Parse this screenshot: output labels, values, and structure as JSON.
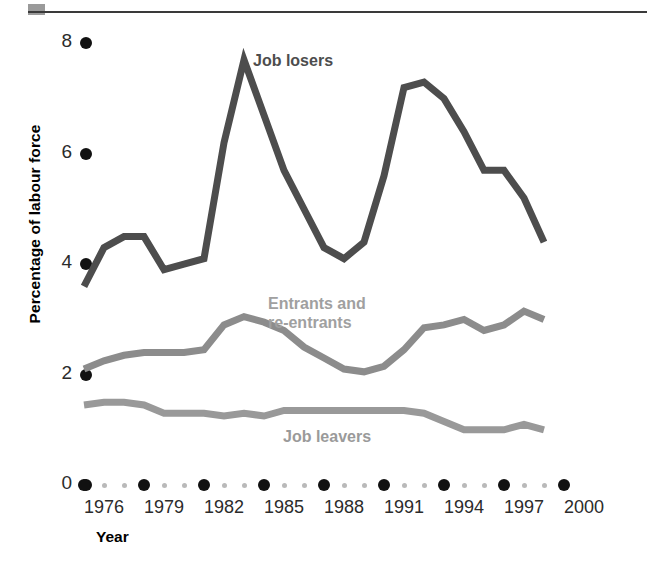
{
  "figure": {
    "decoration": {
      "top_rule": true,
      "top_marker_color": "#9a9a9a"
    }
  },
  "axes": {
    "y_title": "Percentage of labour force",
    "x_title": "Year",
    "y_ticks": [
      "8",
      "6",
      "4",
      "2",
      "0"
    ],
    "x_ticks": [
      "1976",
      "1979",
      "1982",
      "1985",
      "1988",
      "1991",
      "1994",
      "1997",
      "2000"
    ]
  },
  "labels": {
    "job_losers": "Job losers",
    "entrants": "Entrants and\nre-entrants",
    "job_leavers": "Job leavers"
  },
  "colors": {
    "job_losers": "#4d4d4d",
    "entrants": "#8c8c8c",
    "job_leavers": "#999999",
    "job_losers_label": "#4d4d4d",
    "entrants_label": "#a0a0a0",
    "job_leavers_label": "#9a9a9a",
    "tick_major": "#111111",
    "tick_minor": "#b9b9b9",
    "rule": "#3a3a3a"
  },
  "chart_data": {
    "type": "line",
    "title": "",
    "xlabel": "Year",
    "ylabel": "Percentage of labour force",
    "xlim": [
      1975,
      2000
    ],
    "ylim": [
      0,
      8
    ],
    "ytick_values": [
      8,
      6,
      4,
      2,
      0
    ],
    "xtick_values": [
      1976,
      1979,
      1982,
      1985,
      1988,
      1991,
      1994,
      1997,
      2000
    ],
    "grid": false,
    "legend": "inline-annotations",
    "x": [
      1975,
      1976,
      1977,
      1978,
      1979,
      1980,
      1981,
      1982,
      1983,
      1984,
      1985,
      1986,
      1987,
      1988,
      1989,
      1990,
      1991,
      1992,
      1993,
      1994,
      1995,
      1996,
      1997,
      1998
    ],
    "series": [
      {
        "name": "Job losers",
        "color": "#4d4d4d",
        "values": [
          3.6,
          4.3,
          4.5,
          4.5,
          3.9,
          4.0,
          4.1,
          6.2,
          7.7,
          6.7,
          5.7,
          5.0,
          4.3,
          4.1,
          4.4,
          5.6,
          7.2,
          7.3,
          7.0,
          6.4,
          5.7,
          5.7,
          5.2,
          4.4
        ]
      },
      {
        "name": "Entrants and re-entrants",
        "color": "#8c8c8c",
        "values": [
          2.1,
          2.25,
          2.35,
          2.4,
          2.4,
          2.4,
          2.45,
          2.9,
          3.05,
          2.95,
          2.8,
          2.5,
          2.3,
          2.1,
          2.05,
          2.15,
          2.45,
          2.85,
          2.9,
          3.0,
          2.8,
          2.9,
          3.15,
          3.0
        ]
      },
      {
        "name": "Job leavers",
        "color": "#999999",
        "values": [
          1.45,
          1.5,
          1.5,
          1.45,
          1.3,
          1.3,
          1.3,
          1.25,
          1.3,
          1.25,
          1.35,
          1.35,
          1.35,
          1.35,
          1.35,
          1.35,
          1.35,
          1.3,
          1.15,
          1.0,
          1.0,
          1.0,
          1.1,
          1.0
        ]
      }
    ]
  }
}
